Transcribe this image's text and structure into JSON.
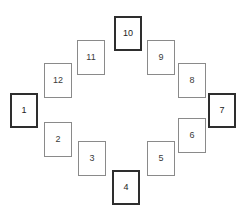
{
  "figure": {
    "background_color": "#ffffff",
    "width": 246,
    "height": 221,
    "accent_color": "#2e2e2e",
    "muted_color": "#8a8a8a",
    "label_color": "#3a3a3a"
  },
  "chart_data": {
    "type": "diagram",
    "title": "",
    "subtitle": "",
    "xlabel": "",
    "ylabel": "",
    "grid": false,
    "legend": null,
    "layout": "clock-face circular arrangement of 12 rectangular cards",
    "card_width": 28,
    "card_height": 35,
    "emphasis_rule": "cards at the four cardinal clock positions (1, 4, 7, 10) are drawn with a thick dark border; all others use a thin gray border",
    "categories": [
      "1",
      "2",
      "3",
      "4",
      "5",
      "6",
      "7",
      "8",
      "9",
      "10",
      "11",
      "12"
    ],
    "values": [
      1,
      2,
      3,
      4,
      5,
      6,
      7,
      8,
      9,
      10,
      11,
      12
    ],
    "items": [
      {
        "label": "1",
        "x": 10,
        "y": 93,
        "w": 28,
        "h": 35,
        "emphasis": "thick"
      },
      {
        "label": "2",
        "x": 44,
        "y": 122,
        "w": 28,
        "h": 35,
        "emphasis": "thin"
      },
      {
        "label": "3",
        "x": 78,
        "y": 141,
        "w": 28,
        "h": 35,
        "emphasis": "thin"
      },
      {
        "label": "4",
        "x": 112,
        "y": 170,
        "w": 28,
        "h": 35,
        "emphasis": "thick"
      },
      {
        "label": "5",
        "x": 147,
        "y": 141,
        "w": 28,
        "h": 35,
        "emphasis": "thin"
      },
      {
        "label": "6",
        "x": 178,
        "y": 118,
        "w": 28,
        "h": 35,
        "emphasis": "thin"
      },
      {
        "label": "7",
        "x": 208,
        "y": 93,
        "w": 28,
        "h": 35,
        "emphasis": "thick"
      },
      {
        "label": "8",
        "x": 178,
        "y": 63,
        "w": 28,
        "h": 35,
        "emphasis": "thin"
      },
      {
        "label": "9",
        "x": 147,
        "y": 40,
        "w": 28,
        "h": 35,
        "emphasis": "thin"
      },
      {
        "label": "10",
        "x": 114,
        "y": 16,
        "w": 28,
        "h": 35,
        "emphasis": "thick"
      },
      {
        "label": "11",
        "x": 77,
        "y": 40,
        "w": 28,
        "h": 35,
        "emphasis": "thin"
      },
      {
        "label": "12",
        "x": 44,
        "y": 63,
        "w": 28,
        "h": 35,
        "emphasis": "thin"
      }
    ]
  }
}
